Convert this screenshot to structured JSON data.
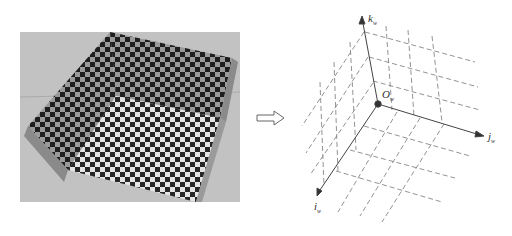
{
  "figure": {
    "left_panel": {
      "description": "Photograph of a three-plane checkerboard calibration box (two walls and a floor)",
      "icon": "checkerboard-photo"
    },
    "arrow": {
      "icon": "hollow-right-arrow"
    },
    "right_panel": {
      "description": "World coordinate system with dashed grid lines on three planes",
      "origin_label": "O",
      "origin_sub": "w",
      "axes": [
        {
          "name": "k",
          "sub": "w",
          "direction": "up"
        },
        {
          "name": "j",
          "sub": "w",
          "direction": "right-down"
        },
        {
          "name": "i",
          "sub": "w",
          "direction": "left-down"
        }
      ]
    },
    "colors": {
      "line": "#555555",
      "dash": "#777777",
      "dark_square": "#2a2a2a",
      "light_square": "#e8e8e8",
      "floor_bg": "#c8c8c8"
    }
  }
}
